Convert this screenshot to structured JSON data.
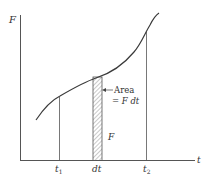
{
  "diagram": {
    "type": "force-time area diagram",
    "axes": {
      "y_label": "F",
      "x_label": "t"
    },
    "ticks": {
      "t1": {
        "base": "t",
        "sub": "1"
      },
      "dt": "dt",
      "t2": {
        "base": "t",
        "sub": "2"
      }
    },
    "annotations": {
      "area_line1": "Area",
      "area_line2": "= F dt",
      "strip_height": "F"
    },
    "colors": {
      "line": "#3a3a3a",
      "axis": "#555555",
      "hatch": "#777777",
      "background": "#ffffff"
    }
  }
}
